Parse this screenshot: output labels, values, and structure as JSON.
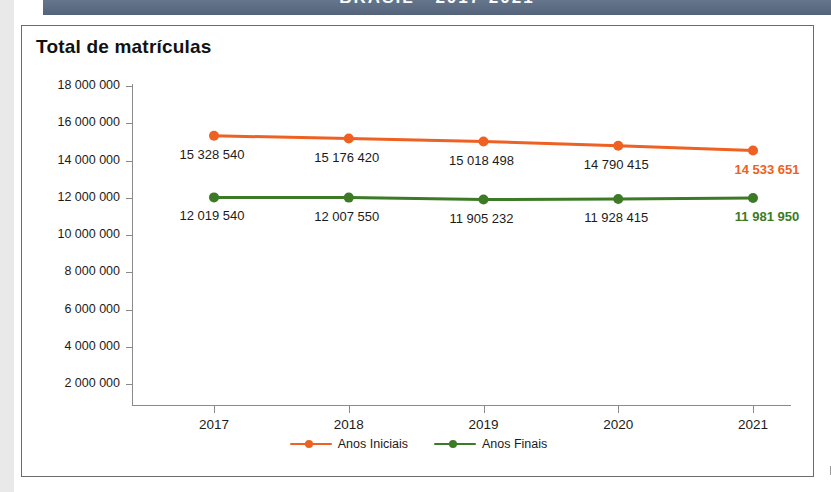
{
  "banner": {
    "text": "BRASIL - 2017-2021"
  },
  "figure": {
    "title": "Total de matrículas"
  },
  "chart_data": {
    "type": "line",
    "title": "Total de matrículas",
    "xlabel": "",
    "ylabel": "",
    "categories": [
      "2017",
      "2018",
      "2019",
      "2020",
      "2021"
    ],
    "ylim": [
      0,
      18000000
    ],
    "yticks": [
      2000000,
      4000000,
      6000000,
      8000000,
      10000000,
      12000000,
      14000000,
      16000000,
      18000000
    ],
    "ytick_labels": [
      "2 000 000",
      "4 000 000",
      "6 000 000",
      "8 000 000",
      "10 000 000",
      "12 000 000",
      "14 000 000",
      "16 000 000",
      "18 000 000"
    ],
    "grid": false,
    "legend_position": "bottom",
    "series": [
      {
        "name": "Anos Iniciais",
        "color": "#ee6123",
        "values": [
          15328540,
          15176420,
          15018498,
          14790415,
          14533651
        ],
        "labels": [
          "15 328 540",
          "15 176 420",
          "15 018 498",
          "14 790 415",
          "14 533 651"
        ],
        "highlight_last": true
      },
      {
        "name": "Anos Finais",
        "color": "#3c7a26",
        "values": [
          12019540,
          12007550,
          11905232,
          11928415,
          11981950
        ],
        "labels": [
          "12 019 540",
          "12 007 550",
          "11 905 232",
          "11 928 415",
          "11 981 950"
        ],
        "highlight_last": true
      }
    ]
  },
  "legend": {
    "items": [
      {
        "label": "Anos Iniciais",
        "color": "#ee6123"
      },
      {
        "label": "Anos Finais",
        "color": "#3c7a26"
      }
    ]
  }
}
